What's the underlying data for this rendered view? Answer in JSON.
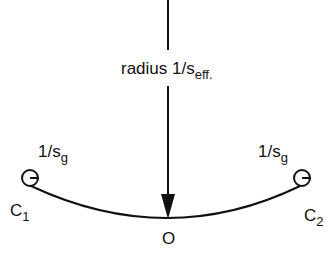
{
  "diagram": {
    "radius_label": {
      "main": "radius 1/s",
      "sub": "eff."
    },
    "left_curvature_label": {
      "main": "1/s",
      "sub": "g"
    },
    "right_curvature_label": {
      "main": "1/s",
      "sub": "g"
    },
    "point_c1": {
      "main": "C",
      "sub": "1"
    },
    "point_c2": {
      "main": "C",
      "sub": "2"
    },
    "point_o": "O",
    "colors": {
      "stroke": "#111111",
      "background": "#ffffff"
    }
  }
}
